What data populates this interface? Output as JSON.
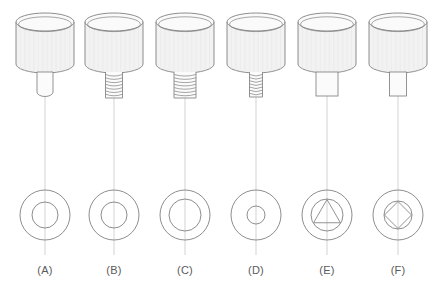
{
  "figure": {
    "type": "engineering-drawing",
    "background_color": "#ffffff",
    "line_color": "#808080",
    "centerline_color": "#c8c8c8",
    "label_color": "#5a5a5a",
    "head_fill": "#f2f2f2",
    "head_top_fill": "#fafafa",
    "shank_fill": "#fbfbfb",
    "columns": [
      {
        "id": "A",
        "label": "(A)",
        "center_x": 45,
        "shank_type": "plain-round-rounded-end",
        "shank_width": 16,
        "shank_height": 24,
        "plan_view": {
          "outer_r": 25,
          "inner_r": 13,
          "inscribed_shape": "none"
        }
      },
      {
        "id": "B",
        "label": "(B)",
        "center_x": 114,
        "shank_type": "threaded-narrow",
        "shank_width": 17,
        "shank_height": 26,
        "thread_turns": 7,
        "plan_view": {
          "outer_r": 25,
          "inner_r": 13,
          "inscribed_shape": "none"
        }
      },
      {
        "id": "C",
        "label": "(C)",
        "center_x": 185,
        "shank_type": "threaded-wide",
        "shank_width": 22,
        "shank_height": 26,
        "thread_turns": 7,
        "plan_view": {
          "outer_r": 25,
          "inner_r": 16,
          "inscribed_shape": "none"
        }
      },
      {
        "id": "D",
        "label": "(D)",
        "center_x": 256,
        "shank_type": "threaded-fine",
        "shank_width": 13,
        "shank_height": 25,
        "thread_turns": 7,
        "plan_view": {
          "outer_r": 25,
          "inner_r": 9,
          "inscribed_shape": "none"
        }
      },
      {
        "id": "E",
        "label": "(E)",
        "center_x": 327,
        "shank_type": "plain-square-wide",
        "shank_width": 22,
        "shank_height": 24,
        "plan_view": {
          "outer_r": 25,
          "inner_r": 16,
          "inscribed_shape": "triangle"
        }
      },
      {
        "id": "F",
        "label": "(F)",
        "center_x": 398,
        "shank_type": "plain-square-narrow",
        "shank_width": 17,
        "shank_height": 24,
        "plan_view": {
          "outer_r": 25,
          "inner_r": 14,
          "inscribed_shape": "square-diamond"
        }
      }
    ],
    "head": {
      "width": 58,
      "body_height": 42,
      "ellipse_ry": 9,
      "top_y": 22,
      "knurl_lines": 13
    },
    "plan_view_center_y": 215,
    "label_y": 264,
    "centerline_top": 24,
    "centerline_bottom": 255
  }
}
